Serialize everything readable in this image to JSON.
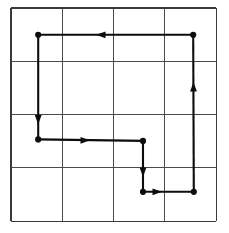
{
  "figure": {
    "title": "",
    "background_color": "#ffffff",
    "width": 229,
    "height": 233
  },
  "chart_data": {
    "type": "diagram",
    "subtype": "lattice-path-on-grid",
    "title": "",
    "subtitle": "",
    "xlabel": "",
    "ylabel": "",
    "grid": {
      "visible": true,
      "rows": 4,
      "columns": 4,
      "line_color": "#4a4a4a",
      "line_width": 1.1,
      "border_color": "#3a3a3a",
      "border_width": 1.4,
      "x_lines": [
        11,
        62.3,
        113.6,
        164.9,
        216.2
      ],
      "y_lines": [
        8,
        61.3,
        114.6,
        167.9,
        221.2
      ],
      "x_min": 11,
      "x_max": 216.2,
      "y_min": 8,
      "y_max": 221.2
    },
    "path": {
      "closed": true,
      "direction": "counterclockwise",
      "stroke_color": "#0d0d0d",
      "stroke_width": 2.1,
      "vertex_marker": "filled-circle",
      "vertex_marker_radius": 3.1,
      "vertices": [
        {
          "id": "v1",
          "x": 193.2,
          "y": 34.8,
          "label": ""
        },
        {
          "id": "v2",
          "x": 38.2,
          "y": 34.8,
          "label": ""
        },
        {
          "id": "v3",
          "x": 38.2,
          "y": 139.4,
          "label": ""
        },
        {
          "id": "v4",
          "x": 143.0,
          "y": 140.9,
          "label": ""
        },
        {
          "id": "v5",
          "x": 143.0,
          "y": 191.8,
          "label": ""
        },
        {
          "id": "v6",
          "x": 193.8,
          "y": 191.8,
          "label": ""
        }
      ],
      "segments": [
        {
          "from": "v1",
          "to": "v2",
          "orientation": "horizontal",
          "direction": "left",
          "arrow_at": {
            "x": 96.0,
            "y": 34.8
          }
        },
        {
          "from": "v2",
          "to": "v3",
          "orientation": "vertical",
          "direction": "down",
          "arrow_at": {
            "x": 38.2,
            "y": 124.5
          }
        },
        {
          "from": "v3",
          "to": "v4",
          "orientation": "horizontal",
          "direction": "right",
          "arrow_at": {
            "x": 90.0,
            "y": 140.3
          }
        },
        {
          "from": "v4",
          "to": "v5",
          "orientation": "vertical",
          "direction": "down",
          "arrow_at": {
            "x": 143.0,
            "y": 177.0
          }
        },
        {
          "from": "v5",
          "to": "v6",
          "orientation": "horizontal",
          "direction": "right",
          "arrow_at": {
            "x": 162.0,
            "y": 191.8
          }
        },
        {
          "from": "v6",
          "to": "v1",
          "orientation": "vertical",
          "direction": "up",
          "arrow_at": {
            "x": 193.5,
            "y": 82.0
          }
        }
      ],
      "arrow_head": {
        "length": 9.5,
        "half_width": 3.4,
        "color": "#0d0d0d"
      }
    },
    "legend": {
      "visible": false,
      "position": "none"
    },
    "annotations": []
  }
}
